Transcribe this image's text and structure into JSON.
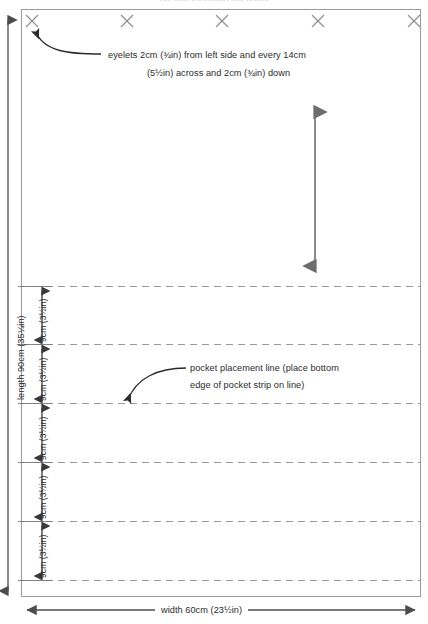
{
  "diagram": {
    "title_partial": "cut one rectangle per panel",
    "panel": {
      "name": "fabric-rectangle",
      "x": 21,
      "y": 9,
      "width": 400,
      "height": 588,
      "border_color": "#9a9a9a",
      "fill": "#ffffff"
    },
    "eyelets": {
      "icon": "cross-mark",
      "color": "#8c8c8c",
      "count": 5,
      "positions_x": [
        32,
        127,
        222,
        318,
        414
      ],
      "position_y": 21,
      "size": 13,
      "callout": {
        "line1": "eyelets 2cm (¾in) from left side and every 14cm",
        "line2": "(5½in) across and 2cm (¾in) down"
      }
    },
    "pocket_lines": {
      "count": 6,
      "positions_y": [
        286,
        344,
        403,
        462,
        521,
        580
      ],
      "color": "#9a9a9a",
      "style": "dashed",
      "callout": {
        "line1": "pocket placement line (place bottom",
        "line2": "edge of pocket strip on line)"
      }
    },
    "center_arrow": {
      "name": "vertical-double-arrow",
      "x": 315,
      "y_top": 105,
      "y_bottom": 272,
      "color": "#6e6e6e"
    },
    "dimensions": {
      "length": {
        "label": "length 90cm (35¼in)",
        "axis_x": 8,
        "y_top": 14,
        "y_bottom": 597,
        "color": "#4d4d4d"
      },
      "width": {
        "label": "width 60cm (23½in)",
        "axis_y": 610,
        "x_left": 21,
        "x_right": 421,
        "color": "#4d4d4d"
      },
      "segments": [
        {
          "label": "9cm (3½in)",
          "y_top": 286,
          "y_bottom": 344
        },
        {
          "label": "9cm (3½in)",
          "y_top": 344,
          "y_bottom": 403
        },
        {
          "label": "9cm (3½in)",
          "y_top": 403,
          "y_bottom": 462
        },
        {
          "label": "9cm (3½in)",
          "y_top": 462,
          "y_bottom": 521
        },
        {
          "label": "9cm (3½in)",
          "y_top": 521,
          "y_bottom": 580
        }
      ],
      "segment_axis_x": 42,
      "segment_color": "#3a3a3a"
    }
  }
}
